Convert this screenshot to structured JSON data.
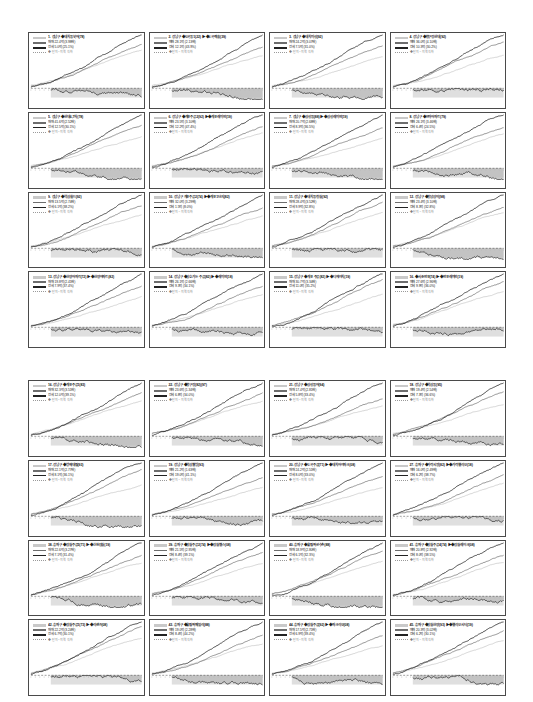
{
  "figure": {
    "type": "small-multiples-grid",
    "panel_columns": 4,
    "panel_rows_per_block": 4,
    "blocks": 2,
    "total_panels": 32,
    "background": "#ffffff",
    "panel_border_color": "#4a4a4a"
  },
  "legend_style": {
    "series": [
      {
        "key": "light",
        "color": "#c6c6c6",
        "role": "reference-index"
      },
      {
        "key": "mid",
        "color": "#707070",
        "role": "district-index"
      },
      {
        "key": "dark",
        "color": "#1f1f1f",
        "role": "complex-index"
      },
      {
        "key": "dotted",
        "color": "#9a9a9a",
        "role": "spread"
      }
    ],
    "zero_band_color": "#c4c4c4",
    "negative_area_color": "#b9b9b9"
  },
  "chart_data": {
    "type": "line",
    "xlabel": "",
    "ylabel": "",
    "grid": false,
    "legend_position": "top-left",
    "note": "각 패널: 연한 선=전체 지수, 중간 선=지역 지수, 진한 선=단지 지수, 하단 음영=기준선 대비 격차",
    "panels": [
      {
        "n": 1,
        "block": 1,
        "title": "1. 강남구 ◆대치동북아(78)",
        "stat1": "매매 22.4억 (3.98배)",
        "stat2": "전세 5.0억 (25.1%)",
        "stat3": "◆ 단지 ~ 지역 격차"
      },
      {
        "n": 2,
        "block": 1,
        "title": "2. 강남구 ◆도곡동1(22) ▶ ◆도곡렉슬(39)",
        "stat1": "매매 28.1억 (2.13배)",
        "stat2": "전세 12.1억 (43.9%)",
        "stat3": "◆ 단지 ~ 지역 격차"
      },
      {
        "n": 3,
        "block": 1,
        "title": "3. 강남구 ◆대치미성(92)",
        "stat1": "매매 24.2억 (3.07배)",
        "stat2": "전세 7.5억 (31.0%)",
        "stat3": "◆ 단지 ~ 지역 격차"
      },
      {
        "n": 4,
        "block": 1,
        "title": "4. 강남구 ◆압구정현대(92)",
        "stat1": "매매 36.0억 (4.10배)",
        "stat2": "전세 10.3억 (30.2%)",
        "stat3": "◆ 단지 ~ 지역 격차"
      },
      {
        "n": 5,
        "block": 1,
        "title": "5. 강남구 ◆현대6,7차(78)",
        "stat1": "매매 41.6억 (2.52배)",
        "stat2": "전세 12.5억 (30.1%)",
        "stat3": "◆ 단지 ~ 지역 격차"
      },
      {
        "n": 6,
        "block": 1,
        "title": "6. 강남구 ◆개포주공2(92) ▶ ◆개포래미안(19)",
        "stat1": "매매 23.5억 (3.10배)",
        "stat2": "전세 12.2억 (47.4%)",
        "stat3": "◆ 단지 ~ 지역 격차"
      },
      {
        "n": 7,
        "block": 1,
        "title": "7. 강남구 ◆삼성동(88) ▶ ◆삼성래미안(19)",
        "stat1": "매매 20.7억 (2.68배)",
        "stat2": "전세 8.3억 (36.5%)",
        "stat3": "◆ 단지 ~ 지역 격차"
      },
      {
        "n": 8,
        "block": 1,
        "title": "8. 강남구 ◆은마아파트(79)",
        "stat1": "매매 26.1억 (3.46배)",
        "stat2": "전세 6.4억 (24.5%)",
        "stat3": "◆ 단지 ~ 지역 격차"
      },
      {
        "n": 9,
        "block": 1,
        "title": "9. 강남구 ◆역삼월드(92)",
        "stat1": "매매 13.5억 (2.74배)",
        "stat2": "전세 6.1억 (38.2%)",
        "stat3": "◆ 단지 ~ 지역 격차"
      },
      {
        "n": 10,
        "block": 1,
        "title": "10. 강남구 개포주공2(74) ▶ ◆개포1단지(82)",
        "stat1": "매매 32.0억 (3.29배)",
        "stat2": "전세 1.5억 (8.0%)",
        "stat3": "◆ 단지 ~ 지역 격차"
      },
      {
        "n": 11,
        "block": 1,
        "title": "11. 강남구 ◆대치동 청실(92)",
        "stat1": "매매 28.4억 (3.52배)",
        "stat2": "전세 9.9억 (32.8%)",
        "stat3": "◆ 단지 ~ 지역 격차"
      },
      {
        "n": 12,
        "block": 1,
        "title": "12. 강남구 ◆청담삼익(98)",
        "stat1": "매매 23.4억 (3.10배)",
        "stat2": "전세 8.3억 (32.8%)",
        "stat3": "◆ 단지 ~ 지역 격차"
      },
      {
        "n": 13,
        "block": 1,
        "title": "13. 강남구 ◆한양아파트(72) ▶ ◆한양아파트(82)",
        "stat1": "매매 19.8억 (2.41배)",
        "stat2": "전세 7.9억 (37.4%)",
        "stat3": "◆ 단지 ~ 지역 격차"
      },
      {
        "n": 14,
        "block": 1,
        "title": "14. 강남구 ◆삼호가든 주공(82) ▶ ◆래미안(18)",
        "stat1": "매매 26.1억 (2.66배)",
        "stat2": "전세 9.3억 (34.1%)",
        "stat3": "◆ 단지 ~ 지역 격차"
      },
      {
        "n": 15,
        "block": 1,
        "title": "15. 강남구 ◆개포 주공(82) ▶ ◆디에이치(19)",
        "stat1": "매매 30.7억 (3.34배)",
        "stat2": "전세 11.0억 (35.2%)",
        "stat3": "◆ 단지 ~ 지역 격차"
      },
      {
        "n": 16,
        "block": 1,
        "title": "16. ◆서초반포(74) ▶ ◆반포래미안(19)",
        "stat1": "매매 27.6억 (2.96배)",
        "stat2": "전세 9.9억 (36.0%)",
        "stat3": "◆ 단지 ~ 지역 격차"
      },
      {
        "n": 17,
        "block": 2,
        "title": "16. 강남구 ◆개포주공1(83)",
        "stat1": "매매 32.3억 (3.51배)",
        "stat2": "전세 12.0억 (39.1%)",
        "stat3": "◆ 단지 ~ 지역 격차"
      },
      {
        "n": 18,
        "block": 2,
        "title": "22. 강남구 ◆압구정(82)(97)",
        "stat1": "매매 23.6억 (1.34배)",
        "stat2": "전세 6.8억 (34.0%)",
        "stat3": "◆ 단지 ~ 지역 격차"
      },
      {
        "n": 19,
        "block": 2,
        "title": "21. 강남구 ◆삼성동아(94)",
        "stat1": "매매 17.4억 (2.81배)",
        "stat2": "전세 5.8억 (33.4%)",
        "stat3": "◆ 단지 ~ 지역 격차"
      },
      {
        "n": 20,
        "block": 2,
        "title": "18. 강남구 ◆역삼동(95)",
        "stat1": "매매 19.4억 (2.54배)",
        "stat2": "전세 7.3억 (36.6%)",
        "stat3": "◆ 단지 ~ 지역 격차"
      },
      {
        "n": 21,
        "block": 2,
        "title": "17. 강남구 ◆방배대림(93)",
        "stat1": "매매 22.1억 (2.77배)",
        "stat2": "전세 8.1억 (36.1%)",
        "stat3": "◆ 단지 ~ 지역 격차"
      },
      {
        "n": 22,
        "block": 2,
        "title": "19. 강남구 ◆역삼웰빙(93)",
        "stat1": "매매 21.2억 (1.63배)",
        "stat2": "전세 19.0억 (41.1%)",
        "stat3": "◆ 단지 ~ 지역 격차"
      },
      {
        "n": 23,
        "block": 2,
        "title": "20. 강남구 ◆도곡주공(71) ▶ ◆대치아이파크(08)",
        "stat1": "매매 24.2억 (2.51배)",
        "stat2": "전세 8.0억 (33.0%)",
        "stat3": "◆ 단지 ~ 지역 격차"
      },
      {
        "n": 24,
        "block": 2,
        "title": "27. 송파구 ◆가락시영(82) ▶ ◆가락헬리오(18)",
        "stat1": "매매 16.0억 (2.49배)",
        "stat2": "전세 6.2억 (38.7%)",
        "stat3": "◆ 단지 ~ 지역 격차"
      },
      {
        "n": 25,
        "block": 2,
        "title": "38. 송파구 ◆잠실주공5(71) ▶ ◆신천잠실(19)",
        "stat1": "매매 22.6억 (3.27배)",
        "stat2": "전세 7.1억 (31.4%)",
        "stat3": "◆ 단지 ~ 지역 격차"
      },
      {
        "n": 26,
        "block": 2,
        "title": "39. 송파구 ◆잠실주공2(74) ▶ ◆잠실엘스(08)",
        "stat1": "매매 21.5억 (2.95배)",
        "stat2": "전세 8.4억 (39.1%)",
        "stat3": "◆ 단지 ~ 지역 격차"
      },
      {
        "n": 27,
        "block": 2,
        "title": "40. 송파구 ◆올림픽선수촌(88)",
        "stat1": "매매 18.9억 (2.80배)",
        "stat2": "전세 6.1억 (32.3%)",
        "stat3": "◆ 단지 ~ 지역 격차"
      },
      {
        "n": 28,
        "block": 2,
        "title": "41. 송파구 ◆잠실주공4(74) ▶ ◆잠실레이크(08)",
        "stat1": "매매 20.8억 (2.92배)",
        "stat2": "전세 8.0억 (38.5%)",
        "stat3": "◆ 단지 ~ 지역 격차"
      },
      {
        "n": 29,
        "block": 2,
        "title": "42. 송파구 ◆잠실주공1(73) ▶ ◆리센츠(08)",
        "stat1": "매매 22.2억 (3.24배)",
        "stat2": "전세 6.7억 (30.1%)",
        "stat3": "◆ 단지 ~ 지역 격차"
      },
      {
        "n": 30,
        "block": 2,
        "title": "43. 송파구 ◆올림픽패밀리(88)",
        "stat1": "매매 19.0억 (2.28배)",
        "stat2": "전세 8.4억 (44.2%)",
        "stat3": "◆ 단지 ~ 지역 격차"
      },
      {
        "n": 31,
        "block": 2,
        "title": "44. 송파구 ◆잠실주공(92) ▶ ◆파크리오(08)",
        "stat1": "매매 17.5억 (2.71배)",
        "stat2": "전세 6.9억 (39.4%)",
        "stat3": "◆ 단지 ~ 지역 격차"
      },
      {
        "n": 32,
        "block": 2,
        "title": "45. 송파구 ◆잠실한양(93) ▶ ◆헬리오시티(19)",
        "stat1": "매매 20.3억 (3.02배)",
        "stat2": "전세 6.2억 (30.1%)",
        "stat3": "◆ 단지 ~ 지역 격차"
      }
    ]
  }
}
